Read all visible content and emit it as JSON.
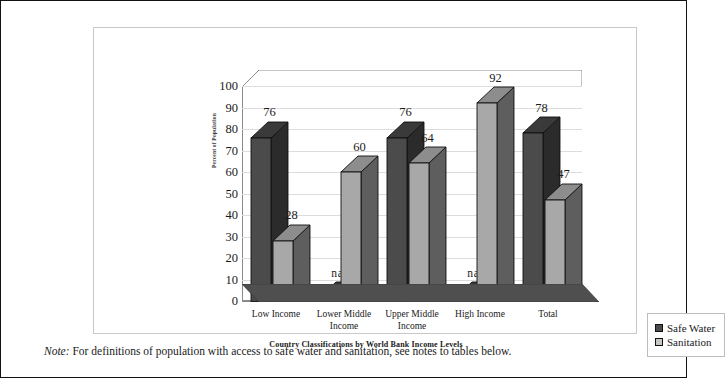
{
  "note": {
    "label": "Note:",
    "text": "For definitions of population with access to safe water and sanitation, see notes to tables below."
  },
  "legend": {
    "items": [
      {
        "label": "Safe Water",
        "color": "#4b4b4b",
        "swatch": "water"
      },
      {
        "label": "Sanitation",
        "color": "#c6c6c6",
        "swatch": "sanitation"
      }
    ]
  },
  "chart_data": {
    "type": "bar",
    "title": "",
    "xlabel": "Country Classifications by World Bank Income Levels",
    "ylabel": "Percent of Population",
    "ylim": [
      0,
      100
    ],
    "ytick_step": 10,
    "yticks": [
      "100",
      "90",
      "80",
      "70",
      "60",
      "50",
      "40",
      "30",
      "20",
      "10",
      "0"
    ],
    "grid": true,
    "three_d": true,
    "legend_position": "bottom-right",
    "categories": [
      "Low Income",
      "Lower Middle Income",
      "Upper Middle Income",
      "High Income",
      "Total"
    ],
    "category_lines": [
      [
        "Low Income"
      ],
      [
        "Lower Middle",
        "Income"
      ],
      [
        "Upper Middle",
        "Income"
      ],
      [
        "High Income"
      ],
      [
        "Total"
      ]
    ],
    "series": [
      {
        "name": "Safe Water",
        "color": "#4b4b4b",
        "values": [
          76,
          null,
          76,
          null,
          78
        ],
        "labels": [
          "76",
          "na",
          "76",
          "na",
          "78"
        ]
      },
      {
        "name": "Sanitation",
        "color": "#a8a8a8",
        "values": [
          28,
          60,
          64,
          92,
          47
        ],
        "labels": [
          "28",
          "60",
          "64",
          "92",
          "47"
        ]
      }
    ],
    "na_marker": "na"
  }
}
